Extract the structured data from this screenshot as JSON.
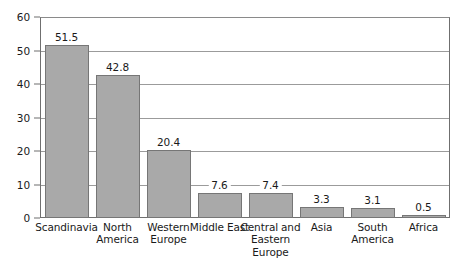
{
  "chart_data": {
    "type": "bar",
    "title": "",
    "subtitle": "",
    "xlabel": "",
    "ylabel": "",
    "ylim": [
      0,
      60
    ],
    "ytick_step": 10,
    "yticks": [
      "0",
      "10",
      "20",
      "30",
      "40",
      "50",
      "60"
    ],
    "grid": true,
    "legend": false,
    "orientation": "vertical",
    "categories": [
      "Scandinavia",
      "North America",
      "Western Europe",
      "Middle East",
      "Central and Eastern Europe",
      "Asia",
      "South America",
      "Africa"
    ],
    "category_lines": [
      [
        "Scandinavia"
      ],
      [
        "North",
        "America"
      ],
      [
        "Western",
        "Europe"
      ],
      [
        "Middle East"
      ],
      [
        "Central and",
        "Eastern",
        "Europe"
      ],
      [
        "Asia"
      ],
      [
        "South",
        "America"
      ],
      [
        "Africa"
      ]
    ],
    "values": [
      51.5,
      42.8,
      20.4,
      7.6,
      7.4,
      3.3,
      3.1,
      0.5
    ],
    "value_labels": [
      "51.5",
      "42.8",
      "20.4",
      "7.6",
      "7.4",
      "3.3",
      "3.1",
      "0.5"
    ],
    "bar_color": "#a9a9a9",
    "bar_border_color": "#767676",
    "gridline_color": "#9b9b9b",
    "axis_color": "#6f6f6f",
    "background_color": "#ffffff",
    "text_color": "#1a1a1a"
  }
}
